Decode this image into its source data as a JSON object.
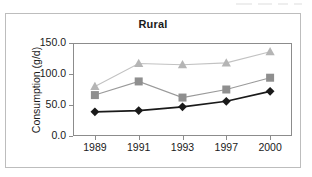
{
  "figure": {
    "background_color": "#ffffff",
    "frame_color": "#bdbdbd",
    "axis_color": "#8c8c8c"
  },
  "chart_data": {
    "type": "line",
    "title": "Rural",
    "xlabel": "",
    "ylabel": "Consumption (g/d)",
    "categories": [
      "1989",
      "1991",
      "1993",
      "1997",
      "2000"
    ],
    "x_tick_labels": [
      "1989",
      "1991",
      "1993",
      "1997",
      "2000"
    ],
    "y_tick_labels": [
      "150.0",
      "100.0",
      "50.0",
      "0.0"
    ],
    "y_tick_values": [
      150.0,
      100.0,
      50.0,
      0.0
    ],
    "ylim": [
      0.0,
      150.0
    ],
    "grid": false,
    "legend": "none",
    "series": [
      {
        "name": "series-triangle-light",
        "marker": "triangle",
        "color": "#b5b5b5",
        "line_color": "#c2c2c2",
        "values": [
          80.0,
          117.0,
          115.0,
          118.0,
          136.0
        ]
      },
      {
        "name": "series-square-medium",
        "marker": "square",
        "color": "#8f8f8f",
        "line_color": "#9a9a9a",
        "values": [
          66.0,
          88.0,
          62.0,
          75.0,
          94.0
        ]
      },
      {
        "name": "series-diamond-dark",
        "marker": "diamond",
        "color": "#1a1a1a",
        "line_color": "#1a1a1a",
        "values": [
          39.0,
          41.0,
          47.0,
          56.0,
          72.0
        ]
      }
    ]
  }
}
